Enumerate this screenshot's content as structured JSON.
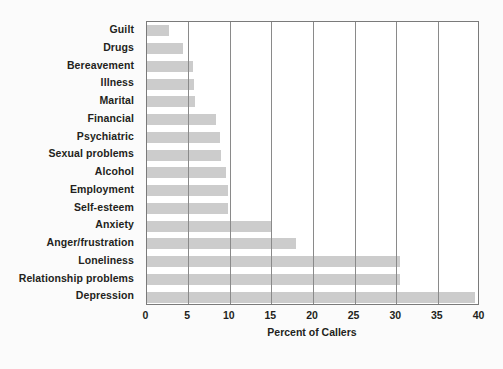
{
  "chart_data": {
    "type": "bar",
    "orientation": "horizontal",
    "title": "",
    "xlabel": "Percent of Callers",
    "ylabel": "",
    "xlim": [
      0,
      40
    ],
    "xticks": [
      0,
      5,
      10,
      15,
      20,
      25,
      30,
      35,
      40
    ],
    "grid": "vertical",
    "legend": "none",
    "bar_color": "#cccccc",
    "categories": [
      "Guilt",
      "Drugs",
      "Bereavement",
      "Illness",
      "Marital",
      "Financial",
      "Psychiatric",
      "Sexual problems",
      "Alcohol",
      "Employment",
      "Self-esteem",
      "Anxiety",
      "Anger/frustration",
      "Loneliness",
      "Relationship problems",
      "Depression"
    ],
    "values": [
      2.7,
      4.4,
      5.6,
      5.7,
      5.8,
      8.3,
      8.8,
      9.0,
      9.6,
      9.8,
      9.8,
      14.9,
      17.9,
      30.4,
      30.4,
      39.5
    ]
  }
}
